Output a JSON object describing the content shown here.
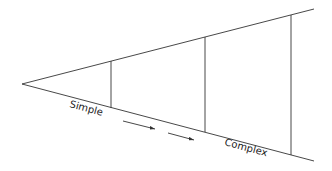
{
  "diagram": {
    "shape": "widening-wedge",
    "labels": {
      "start": "Simple",
      "end": "Complex"
    },
    "colors": {
      "line": "#333333",
      "background": "#ffffff"
    },
    "stages": 3,
    "arrows": 2
  }
}
